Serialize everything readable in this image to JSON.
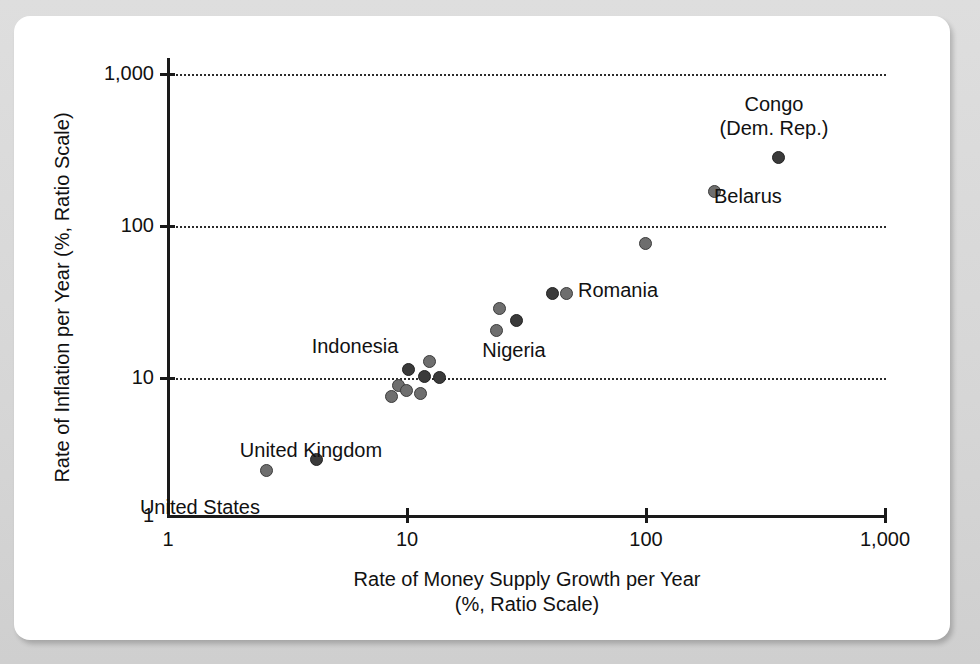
{
  "chart_data": {
    "type": "scatter",
    "title": "",
    "subtitle": "",
    "xlabel_line1": "Rate of Money Supply Growth per Year",
    "xlabel_line2": "(%, Ratio Scale)",
    "ylabel": "Rate of Inflation per Year (%, Ratio Scale)",
    "xscale": "log",
    "yscale": "log",
    "xlim": [
      1,
      1000
    ],
    "ylim": [
      1,
      1000
    ],
    "xticks": [
      1,
      10,
      100,
      1000
    ],
    "xtick_labels": [
      "1",
      "10",
      "100",
      "1,000"
    ],
    "yticks": [
      1,
      10,
      100,
      1000
    ],
    "ytick_labels": [
      "1",
      "10",
      "100",
      "1,000"
    ],
    "grid": "horizontal dotted gridlines at y = 10, 100, 1,000",
    "legend": "none",
    "point_color": "#6e6e6e",
    "point_color_dark": "#3a3a3a",
    "points": [
      {
        "label": "United States",
        "x": 2.6,
        "y": 2.0,
        "shade": "light"
      },
      {
        "label": "United Kingdom",
        "x": 4.2,
        "y": 2.4,
        "shade": "dark"
      },
      {
        "label": "",
        "x": 8.7,
        "y": 6.4,
        "shade": "light"
      },
      {
        "label": "",
        "x": 9.3,
        "y": 7.6,
        "shade": "light"
      },
      {
        "label": "",
        "x": 10.0,
        "y": 7.0,
        "shade": "light"
      },
      {
        "label": "",
        "x": 10.2,
        "y": 9.7,
        "shade": "dark"
      },
      {
        "label": "",
        "x": 11.5,
        "y": 6.7,
        "shade": "light"
      },
      {
        "label": "Indonesia",
        "x": 12.5,
        "y": 11.0,
        "shade": "light"
      },
      {
        "label": "",
        "x": 12.0,
        "y": 8.8,
        "shade": "dark"
      },
      {
        "label": "",
        "x": 13.8,
        "y": 8.6,
        "shade": "dark"
      },
      {
        "label": "Nigeria",
        "x": 24.0,
        "y": 18.0,
        "shade": "light"
      },
      {
        "label": "",
        "x": 24.5,
        "y": 25.5,
        "shade": "light"
      },
      {
        "label": "",
        "x": 29.0,
        "y": 21.0,
        "shade": "dark"
      },
      {
        "label": "",
        "x": 41.0,
        "y": 32.0,
        "shade": "dark"
      },
      {
        "label": "Romania",
        "x": 47.0,
        "y": 32.0,
        "shade": "light"
      },
      {
        "label": "",
        "x": 100.0,
        "y": 70.0,
        "shade": "light"
      },
      {
        "label": "Belarus",
        "x": 196.0,
        "y": 158.0,
        "shade": "light"
      },
      {
        "label": "Congo (Dem. Rep.)",
        "x": 360.0,
        "y": 270.0,
        "shade": "dark"
      }
    ],
    "annotations": [
      {
        "name": "united-states-label",
        "text": "United States"
      },
      {
        "name": "united-kingdom-label",
        "text": "United Kingdom"
      },
      {
        "name": "indonesia-label",
        "text": "Indonesia"
      },
      {
        "name": "nigeria-label",
        "text": "Nigeria"
      },
      {
        "name": "romania-label",
        "text": "Romania"
      },
      {
        "name": "belarus-label",
        "text": "Belarus"
      },
      {
        "name": "congo-label-line1",
        "text": "Congo"
      },
      {
        "name": "congo-label-line2",
        "text": "(Dem. Rep.)"
      }
    ]
  }
}
